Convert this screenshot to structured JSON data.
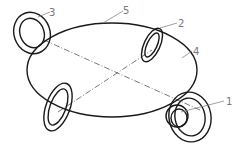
{
  "diagram": {
    "type": "technical line drawing",
    "colors": {
      "stroke": "#1a1a1a",
      "leader": "#888888",
      "centerline": "#555555",
      "label": "#777777"
    },
    "main_ellipse": {
      "label": "4",
      "cx": 112,
      "cy": 70,
      "rx": 85,
      "ry": 47,
      "rotate": 0
    },
    "centerlines": [
      {
        "x1": 44,
        "y1": 40,
        "x2": 200,
        "y2": 110
      },
      {
        "x1": 58,
        "y1": 112,
        "x2": 152,
        "y2": 50
      }
    ],
    "rings": [
      {
        "name": "ring-3",
        "label": "3",
        "cx": 32,
        "cy": 33,
        "outer": {
          "rx": 18,
          "ry": 21
        },
        "inner": {
          "rx": 12,
          "ry": 15
        },
        "rotate": -20
      },
      {
        "name": "ring-2",
        "label": "2",
        "cx": 152,
        "cy": 45,
        "outer": {
          "rx": 8,
          "ry": 18
        },
        "inner": {
          "rx": 5,
          "ry": 13
        },
        "rotate": 25
      },
      {
        "name": "ring-bottom-left",
        "label": "",
        "cx": 58,
        "cy": 107,
        "outer": {
          "rx": 12,
          "ry": 25
        },
        "inner": {
          "rx": 8,
          "ry": 19
        },
        "rotate": 20
      },
      {
        "name": "ring-1",
        "label": "1",
        "cx": 190,
        "cy": 117,
        "outer": {
          "rx": 21,
          "ry": 25
        },
        "inner": {
          "rx": 15,
          "ry": 19
        },
        "rotate": -10
      }
    ],
    "small_ring_1": {
      "cx": 177,
      "cy": 116,
      "outer": {
        "rx": 11,
        "ry": 11
      },
      "inner": {
        "rx": 8,
        "ry": 9
      }
    },
    "labels": [
      {
        "id": "label-3",
        "text": "3",
        "x": 49,
        "y": 8
      },
      {
        "id": "label-5",
        "text": "5",
        "x": 123,
        "y": 6
      },
      {
        "id": "label-2",
        "text": "2",
        "x": 178,
        "y": 19
      },
      {
        "id": "label-4",
        "text": "4",
        "x": 193,
        "y": 47
      },
      {
        "id": "label-1",
        "text": "1",
        "x": 226,
        "y": 97
      }
    ],
    "leaders": [
      {
        "to": "3",
        "x1": 38,
        "y1": 17,
        "x2": 50,
        "y2": 12
      },
      {
        "to": "5",
        "x1": 103,
        "y1": 23,
        "x2": 123,
        "y2": 11
      },
      {
        "to": "2",
        "x1": 160,
        "y1": 28,
        "x2": 177,
        "y2": 23
      },
      {
        "to": "4",
        "x1": 182,
        "y1": 58,
        "x2": 192,
        "y2": 51
      },
      {
        "to": "1",
        "x1": 181,
        "y1": 112,
        "x2": 224,
        "y2": 101
      }
    ]
  }
}
